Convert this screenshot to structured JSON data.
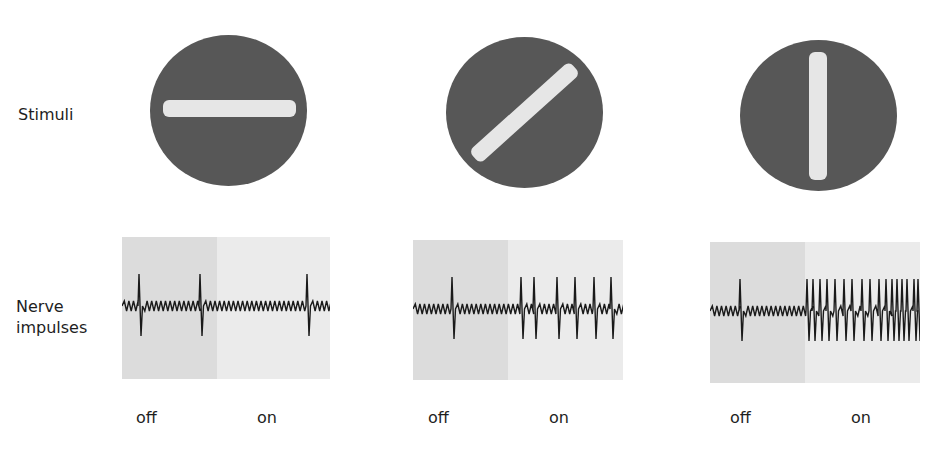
{
  "labels": {
    "stimuli": "Stimuli",
    "nerve_line1": "Nerve",
    "nerve_line2": "impulses"
  },
  "colors": {
    "disc": "#575757",
    "bar": "#e6e6e6",
    "off_bg": "#dcdcdc",
    "on_bg": "#ebebeb",
    "trace": "#1a1a1a"
  },
  "stimuli": [
    {
      "orientation": "horizontal",
      "angle_deg": 0
    },
    {
      "orientation": "diagonal",
      "angle_deg": -42
    },
    {
      "orientation": "vertical",
      "angle_deg": 90
    }
  ],
  "recordings": [
    {
      "off_label": "off",
      "on_label": "on",
      "off_spikes": 2,
      "on_spikes": 1,
      "spike_x_rel": [
        17,
        78,
        185
      ]
    },
    {
      "off_label": "off",
      "on_label": "on",
      "off_spikes": 1,
      "on_spikes": 6,
      "spike_x_rel": [
        39,
        108,
        121,
        144,
        162,
        181,
        198
      ]
    },
    {
      "off_label": "off",
      "on_label": "on",
      "off_spikes": 1,
      "on_spikes": 17,
      "spike_x_rel": [
        30,
        97,
        103,
        110,
        117,
        125,
        134,
        142,
        152,
        160,
        169,
        176,
        182,
        187,
        192,
        197,
        204,
        208
      ]
    }
  ]
}
